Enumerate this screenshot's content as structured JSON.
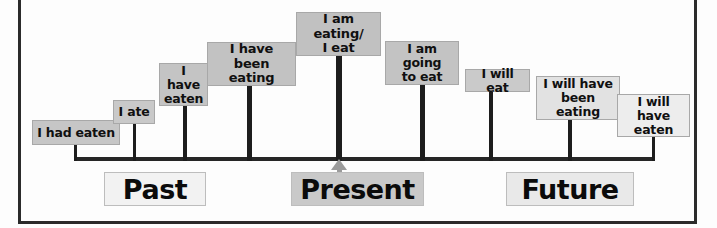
{
  "diagram": {
    "axis": {
      "x": 75,
      "y": 157,
      "width": 580,
      "thickness": 4,
      "color": "#262626"
    },
    "frame_color": "#2b2b2b",
    "arrow": {
      "name": "present-indicator-arrow",
      "color": "#9b9b9b",
      "points": "up"
    },
    "signs": [
      {
        "id": "past-perfect",
        "text": "I had eaten",
        "lines": [
          "I had eaten"
        ],
        "x": 32,
        "y": 120,
        "w": 88,
        "h": 25,
        "stem_x": 75,
        "stem_top": 145,
        "stem_w": 3,
        "fill": "#c6c6c6",
        "font_size": 12.5,
        "connector": "right"
      },
      {
        "id": "simple-past",
        "text": "I ate",
        "lines": [
          "I ate"
        ],
        "x": 113,
        "y": 100,
        "w": 42,
        "h": 24,
        "stem_x": 134,
        "stem_top": 124,
        "stem_w": 3,
        "fill": "#c9c9c9",
        "font_size": 12.5,
        "connector": "none"
      },
      {
        "id": "present-perfect",
        "text": "I have eaten",
        "lines": [
          "I have",
          "eaten"
        ],
        "x": 159,
        "y": 63,
        "w": 49,
        "h": 43,
        "stem_x": 185,
        "stem_top": 106,
        "stem_w": 4,
        "fill": "#c4c4c4",
        "font_size": 12.5,
        "connector": "none"
      },
      {
        "id": "present-perfect-cont",
        "text": "I have been eating",
        "lines": [
          "I have",
          "been eating"
        ],
        "x": 207,
        "y": 42,
        "w": 89,
        "h": 44,
        "stem_x": 249,
        "stem_top": 86,
        "stem_w": 5,
        "fill": "#c2c2c2",
        "font_size": 13,
        "connector": "none"
      },
      {
        "id": "present-continuous",
        "text": "I am eating/ I eat",
        "lines": [
          "I am eating/",
          "I eat"
        ],
        "x": 296,
        "y": 12,
        "w": 85,
        "h": 44,
        "stem_x": 339,
        "stem_top": 56,
        "stem_w": 6,
        "fill": "#c1c1c1",
        "font_size": 13,
        "connector": "none"
      },
      {
        "id": "going-to-future",
        "text": "I am going to eat",
        "lines": [
          "I am going",
          "to eat"
        ],
        "x": 385,
        "y": 41,
        "w": 74,
        "h": 44,
        "stem_x": 422,
        "stem_top": 85,
        "stem_w": 5,
        "fill": "#c3c3c3",
        "font_size": 12.5,
        "connector": "none"
      },
      {
        "id": "simple-future",
        "text": "I will eat",
        "lines": [
          "I will eat"
        ],
        "x": 465,
        "y": 69,
        "w": 65,
        "h": 23,
        "stem_x": 491,
        "stem_top": 92,
        "stem_w": 4,
        "fill": "#cacaca",
        "font_size": 12.5,
        "connector": "none"
      },
      {
        "id": "future-perfect-cont",
        "text": "I will have been eating",
        "lines": [
          "I will have",
          "been eating"
        ],
        "x": 536,
        "y": 76,
        "w": 84,
        "h": 44,
        "stem_x": 570,
        "stem_top": 120,
        "stem_w": 4,
        "fill": "#e2e2e2",
        "font_size": 12.5,
        "connector": "none"
      },
      {
        "id": "future-perfect",
        "text": "I will have eaten",
        "lines": [
          "I will have",
          "eaten"
        ],
        "x": 617,
        "y": 94,
        "w": 73,
        "h": 43,
        "stem_x": 653,
        "stem_top": 137,
        "stem_w": 3,
        "fill": "#ededed",
        "font_size": 12.5,
        "connector": "left"
      }
    ],
    "periods": [
      {
        "id": "past",
        "label": "Past",
        "x": 104,
        "y": 172,
        "w": 102,
        "h": 34,
        "fill": "#f2f2f2",
        "font_size": 27
      },
      {
        "id": "present",
        "label": "Present",
        "x": 291,
        "y": 172,
        "w": 133,
        "h": 34,
        "fill": "#c9c9c9",
        "font_size": 27
      },
      {
        "id": "future",
        "label": "Future",
        "x": 506,
        "y": 172,
        "w": 128,
        "h": 34,
        "fill": "#e9e9e9",
        "font_size": 27
      }
    ]
  }
}
